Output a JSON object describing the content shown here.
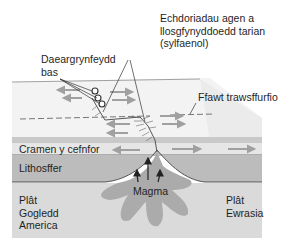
{
  "diagram": {
    "title": "",
    "type": "cross-section of mid-ocean ridge (divergent plate boundary)",
    "labels": {
      "fissure_eruptions": "Echdoriadau agen a\nllosgfynyddoedd tarian\n(sylfaenol)",
      "shallow_earthquakes": "Daeargrynfeydd\nbas",
      "transform_fault": "Ffawt trawsffurfio",
      "oceanic_crust": "Cramen y cefnfor",
      "lithosphere": "Lithosffer",
      "magma": "Magma",
      "north_american_plate": "Plât\nGogledd\nAmerica",
      "eurasian_plate": "Plât\nEwrasia"
    },
    "colors": {
      "ocean_surface": "#f2f2f2",
      "ocean_top_edge": "#8a8a8a",
      "crust_band": "#c9c9c9",
      "crust_light_band": "#e6e6e6",
      "lithosphere": "#b8b8b8",
      "asthenosphere": "#d9d9d9",
      "magma": "#a9a9a9",
      "arrows": "#a0a0a0",
      "lines": "#333333"
    }
  }
}
